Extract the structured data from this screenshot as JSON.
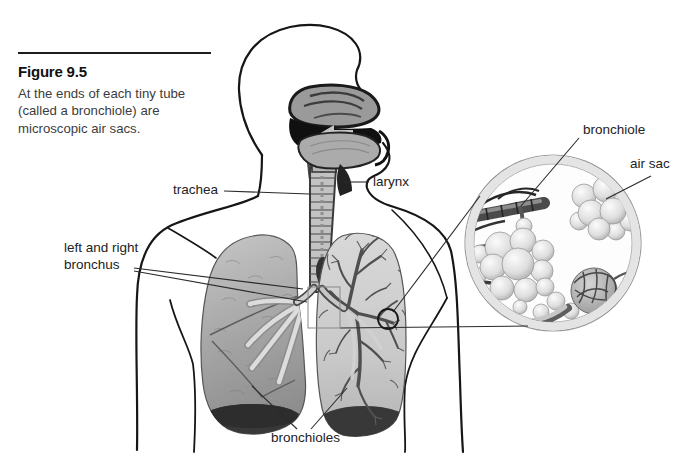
{
  "figure": {
    "number": "Figure 9.5",
    "caption": "At the ends of each tiny tube (called a bronchiole) are microscopic air sacs."
  },
  "labels": {
    "trachea": "trachea",
    "larynx": "larynx",
    "bronchus": "left and right bronchus",
    "bronchioles": "bronchioles",
    "bronchiole": "bronchiole",
    "air_sac": "air sac"
  },
  "colors": {
    "outline": "#1a1a1a",
    "leader_line": "#2b2b2b",
    "lung_gray": "#a9a9a9",
    "lung_dark_base": "#383838",
    "paper": "#ffffff"
  }
}
